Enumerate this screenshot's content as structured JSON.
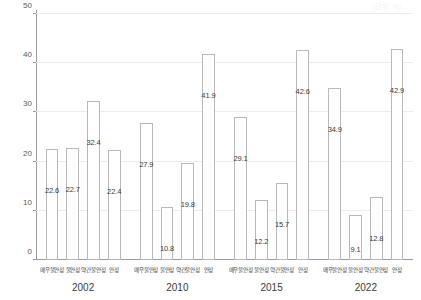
{
  "unit_note": "(단위: %)",
  "chart_data": {
    "type": "bar",
    "title": "",
    "subtitle": "",
    "xlabel": "",
    "ylabel": "",
    "ylim": [
      0,
      50
    ],
    "yticks": [
      0,
      10,
      20,
      30,
      40,
      50
    ],
    "grid": true,
    "legend_position": "none",
    "categories": [
      "매우불안정",
      "불안정",
      "약간불안정",
      "안정"
    ],
    "groups": [
      "2002",
      "2010",
      "2015",
      "2022"
    ],
    "series": [
      {
        "name": "2002",
        "values": [
          22.6,
          22.7,
          32.4,
          22.4
        ]
      },
      {
        "name": "2010",
        "values": [
          27.9,
          10.8,
          19.8,
          41.9
        ]
      },
      {
        "name": "2015",
        "values": [
          29.1,
          12.2,
          15.7,
          42.6
        ]
      },
      {
        "name": "2022",
        "values": [
          34.9,
          9.1,
          12.8,
          42.9
        ]
      }
    ],
    "bar_fill": "#ffffff",
    "bar_stroke": "#b9b9b9",
    "grid_color": "#ececec",
    "axis_color": "#9a9a9a",
    "label_color": "#3a3a3a"
  }
}
